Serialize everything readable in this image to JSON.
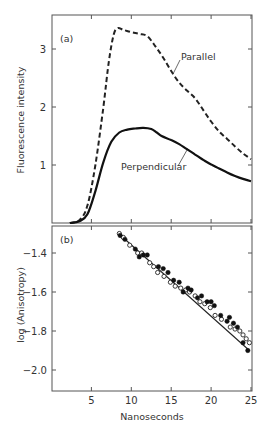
{
  "figure": {
    "panel_a_label": "(a)",
    "panel_b_label": "(b)",
    "ylabel_a": "Fluorescence intensity",
    "ylabel_b": "log (Anisotropy)",
    "xlabel": "Nanoseconds",
    "annotation_parallel": "Parallel",
    "annotation_perpendicular": "Perpendicular",
    "xticks": [
      "5",
      "10",
      "15",
      "20",
      "25"
    ],
    "yticks_a": [
      "3",
      "2",
      "1"
    ],
    "yticks_b": [
      "-1.4",
      "-1.6",
      "-1.8",
      "-2.0"
    ]
  },
  "chart_data": [
    {
      "type": "line",
      "title": "(a)",
      "xlabel": "Nanoseconds",
      "ylabel": "Fluorescence intensity",
      "xlim": [
        0,
        25
      ],
      "ylim": [
        0,
        3.5
      ],
      "xticks": [
        5,
        10,
        15,
        20,
        25
      ],
      "yticks": [
        1,
        2,
        3
      ],
      "grid": false,
      "legend": "inline annotations",
      "series": [
        {
          "name": "Parallel",
          "style": "dashed",
          "x": [
            2.3,
            3.5,
            4.5,
            5.5,
            6.5,
            7.2,
            7.8,
            8.3,
            9.0,
            10.0,
            11.0,
            12.0,
            13.0,
            14.0,
            15.0,
            16.0,
            17.0,
            18.0,
            19.0,
            20.0,
            21.0,
            22.0,
            23.0,
            24.0,
            25.0
          ],
          "values": [
            0.0,
            0.05,
            0.3,
            1.0,
            2.0,
            2.8,
            3.25,
            3.36,
            3.33,
            3.29,
            3.26,
            3.22,
            3.05,
            2.85,
            2.62,
            2.42,
            2.28,
            2.15,
            1.95,
            1.75,
            1.58,
            1.45,
            1.32,
            1.2,
            1.1
          ]
        },
        {
          "name": "Perpendicular",
          "style": "solid",
          "x": [
            2.3,
            3.5,
            4.5,
            5.5,
            6.5,
            7.5,
            8.5,
            9.5,
            10.5,
            11.5,
            12.5,
            13.2,
            13.8,
            15.0,
            16.0,
            17.0,
            18.0,
            19.0,
            20.0,
            21.0,
            22.0,
            23.0,
            24.0,
            25.0
          ],
          "values": [
            0.0,
            0.03,
            0.15,
            0.55,
            1.05,
            1.4,
            1.56,
            1.61,
            1.63,
            1.64,
            1.62,
            1.56,
            1.5,
            1.43,
            1.36,
            1.27,
            1.18,
            1.09,
            1.01,
            0.94,
            0.87,
            0.81,
            0.76,
            0.72
          ]
        }
      ]
    },
    {
      "type": "scatter",
      "title": "(b)",
      "xlabel": "Nanoseconds",
      "ylabel": "log (Anisotropy)",
      "xlim": [
        0,
        25
      ],
      "ylim": [
        -2.1,
        -1.25
      ],
      "xticks": [
        5,
        10,
        15,
        20,
        25
      ],
      "yticks": [
        -1.4,
        -1.6,
        -1.8,
        -2.0
      ],
      "grid": false,
      "series": [
        {
          "name": "fit",
          "style": "solid line",
          "x": [
            8.4,
            24.8
          ],
          "values": [
            -1.3,
            -1.9
          ]
        },
        {
          "name": "filled points",
          "marker": "filled circle",
          "x": [
            8.6,
            9.2,
            10.5,
            11.0,
            11.5,
            12.0,
            13.4,
            14.0,
            14.6,
            15.3,
            16.0,
            16.5,
            17.1,
            17.5,
            18.3,
            18.8,
            19.5,
            20.0,
            20.4,
            21.2,
            22.0,
            22.3,
            22.8,
            23.3,
            24.0,
            24.6
          ],
          "values": [
            -1.31,
            -1.33,
            -1.38,
            -1.42,
            -1.41,
            -1.41,
            -1.47,
            -1.48,
            -1.5,
            -1.54,
            -1.55,
            -1.6,
            -1.58,
            -1.59,
            -1.63,
            -1.62,
            -1.65,
            -1.65,
            -1.67,
            -1.72,
            -1.75,
            -1.73,
            -1.76,
            -1.78,
            -1.86,
            -1.9
          ]
        },
        {
          "name": "open points",
          "marker": "open circle",
          "x": [
            8.5,
            9.0,
            9.8,
            10.8,
            11.3,
            12.3,
            12.8,
            13.3,
            14.1,
            14.9,
            15.5,
            16.2,
            16.8,
            17.3,
            18.0,
            18.6,
            19.2,
            19.9,
            20.5,
            21.3,
            22.4,
            23.0,
            23.6,
            24.0,
            24.4,
            24.8
          ],
          "values": [
            -1.3,
            -1.32,
            -1.36,
            -1.4,
            -1.4,
            -1.45,
            -1.47,
            -1.5,
            -1.52,
            -1.55,
            -1.57,
            -1.58,
            -1.59,
            -1.6,
            -1.62,
            -1.65,
            -1.66,
            -1.68,
            -1.72,
            -1.74,
            -1.78,
            -1.79,
            -1.8,
            -1.82,
            -1.84,
            -1.86
          ]
        }
      ]
    }
  ]
}
